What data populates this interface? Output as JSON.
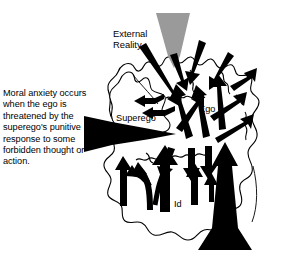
{
  "figure": {
    "kind": "freudian-structural-model-diagram",
    "top_caption": "environment.",
    "left_caption": "Moral anxiety occurs when the ego is threatened by the superego's punitive response to some forbidden thought or action.",
    "labels": {
      "external_reality": "External\nReality",
      "superego": "Superego",
      "ego": "Ego",
      "id": "Id"
    },
    "colors": {
      "ink": "#000000",
      "paper": "#ffffff",
      "wedge_gray": "#9a9a9a"
    }
  }
}
